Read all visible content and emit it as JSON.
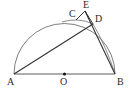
{
  "figure": {
    "width": 130,
    "height": 96,
    "background_color": "#ffffff",
    "stroke_color": "#3a3a3a",
    "arc_color": "#6e6e6e",
    "label_color": "#2b2b2b"
  },
  "labels": {
    "a": "A",
    "b": "B",
    "c": "C",
    "d": "D",
    "e": "E",
    "o": "O"
  },
  "points": {
    "A": {
      "x": 14,
      "y": 74,
      "label": "A",
      "label_x": 8,
      "label_y": 77
    },
    "B": {
      "x": 115,
      "y": 74,
      "label": "B",
      "label_x": 117,
      "label_y": 77
    },
    "O": {
      "x": 64.5,
      "y": 74,
      "label": "O",
      "label_x": 61,
      "label_y": 77
    },
    "C": {
      "x": 76,
      "y": 20,
      "label": "C",
      "label_x": 70,
      "label_y": 11
    },
    "D": {
      "x": 93,
      "y": 24,
      "label": "D",
      "label_x": 95,
      "label_y": 16
    },
    "E": {
      "x": 85,
      "y": 11,
      "label": "E",
      "label_x": 84,
      "label_y": 2
    }
  },
  "segments": [
    {
      "name": "segment-AB",
      "from": "A",
      "to": "B"
    },
    {
      "name": "segment-AD",
      "from": "A",
      "to": "D"
    },
    {
      "name": "segment-CE",
      "from": "C",
      "to": "E"
    },
    {
      "name": "segment-ED",
      "from": "E",
      "to": "D"
    },
    {
      "name": "segment-DB",
      "from": "D",
      "to": "B"
    }
  ],
  "arcs": [
    {
      "name": "arc-semicircle-AB",
      "from": "A",
      "to": "B",
      "through": "apex"
    },
    {
      "name": "arc-CD-small",
      "from": "C",
      "to": "D"
    },
    {
      "name": "arc-DB-small",
      "from": "D",
      "to": "B"
    }
  ],
  "markers": {
    "center_dot": {
      "point": "O",
      "radius": 1.6,
      "filled": true
    }
  }
}
